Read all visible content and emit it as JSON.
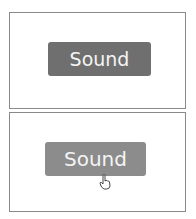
{
  "panels": [
    {
      "state": "default",
      "button": {
        "label": "Sound",
        "color": "#6f6f6f"
      }
    },
    {
      "state": "hover",
      "button": {
        "label": "Sound",
        "color": "#8c8c8c"
      },
      "cursor": "hand-pointer-icon"
    }
  ]
}
